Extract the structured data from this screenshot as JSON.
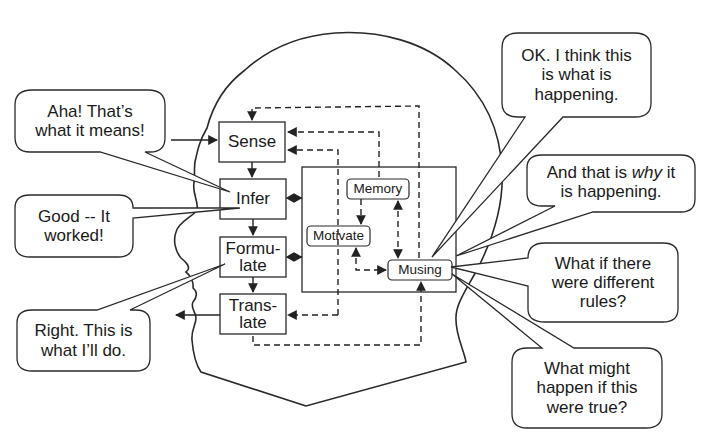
{
  "diagram": {
    "title": "",
    "modules": {
      "sense": "Sense",
      "infer": "Infer",
      "formulate_1": "Formu-",
      "formulate_2": "late",
      "translate_1": "Trans-",
      "translate_2": "late",
      "memory": "Memory",
      "motivate": "Motivate",
      "musing": "Musing"
    },
    "bubbles": {
      "aha": [
        "Aha! That’s",
        "what it means!"
      ],
      "good": [
        "Good -- It",
        "worked!"
      ],
      "right": [
        "Right. This is",
        "what I’ll do."
      ],
      "ok": [
        "OK. I think this",
        "is what is",
        "happening."
      ],
      "why": [
        "And that is ",
        "why",
        " it",
        "is happening."
      ],
      "whatif": [
        "What if there",
        "were different",
        "rules?"
      ],
      "whatmight": [
        "What might",
        "happen if this",
        "were true?"
      ]
    },
    "colors": {
      "stroke": "#2a2a2a",
      "background": "#ffffff"
    }
  }
}
